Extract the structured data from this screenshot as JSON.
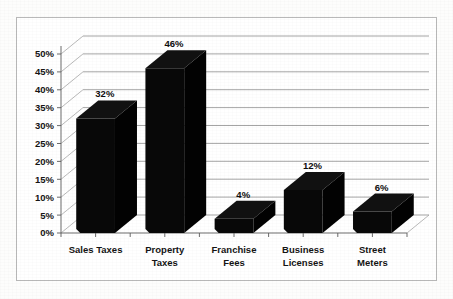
{
  "chart_data": {
    "type": "bar",
    "title": "",
    "subtitle": "",
    "xlabel": "",
    "ylabel": "",
    "categories": [
      "Sales Taxes",
      "Property Taxes",
      "Franchise Fees",
      "Business Licenses",
      "Street Meters"
    ],
    "values": [
      32,
      46,
      4,
      12,
      6
    ],
    "data_labels": [
      "32%",
      "46%",
      "4%",
      "12%",
      "6%"
    ],
    "ylim": [
      0,
      50
    ],
    "ytick_values": [
      0,
      5,
      10,
      15,
      20,
      25,
      30,
      35,
      40,
      45,
      50
    ],
    "ytick_labels": [
      "0%",
      "5%",
      "10%",
      "15%",
      "20%",
      "25%",
      "30%",
      "35%",
      "40%",
      "45%",
      "50%"
    ],
    "grid": true,
    "legend": "none",
    "style": "3d-column",
    "bar_color": "#080808",
    "gridline_color": "#8e8e8e",
    "axis_color": "#6d6d6d",
    "plot_background": "#ffffff",
    "page_background": "#fdfdfc",
    "border_color": "#b9b9b9",
    "category_label_lines": [
      [
        "Sales Taxes"
      ],
      [
        "Property",
        "Taxes"
      ],
      [
        "Franchise",
        "Fees"
      ],
      [
        "Business",
        "Licenses"
      ],
      [
        "Street",
        "Meters"
      ]
    ]
  }
}
